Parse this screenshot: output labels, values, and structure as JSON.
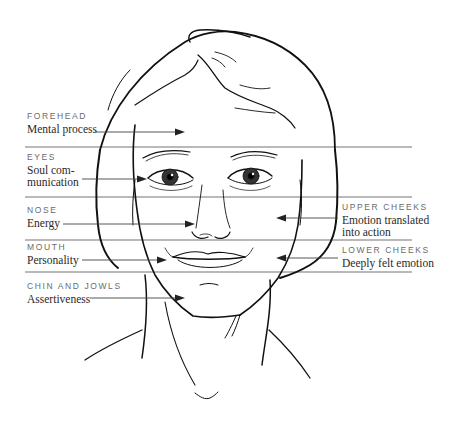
{
  "diagram": {
    "colors": {
      "line": "#111111",
      "divider": "#b9b9b9",
      "caption": "#6b6b6b",
      "text": "#2a2a2a"
    },
    "zones_left": [
      {
        "caption": "FOREHEAD",
        "text": "Mental process"
      },
      {
        "caption": "EYES",
        "text_line1": "Soul com-",
        "text_line2": "munication"
      },
      {
        "caption": "NOSE",
        "text": "Energy"
      },
      {
        "caption": "MOUTH",
        "text": "Personality"
      },
      {
        "caption": "CHIN AND JOWLS",
        "text": "Assertiveness"
      }
    ],
    "zones_right": [
      {
        "caption": "UPPER CHEEKS",
        "text_line1": "Emotion translated",
        "text_line2": "into action"
      },
      {
        "caption": "LOWER CHEEKS",
        "text": "Deeply felt emotion"
      }
    ]
  }
}
